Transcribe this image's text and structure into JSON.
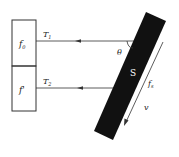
{
  "diagram": {
    "boxes": [
      {
        "label": "f",
        "subscript": "0"
      },
      {
        "label": "f'",
        "subscript": ""
      }
    ],
    "rays": [
      {
        "label": "T",
        "subscript": "1"
      },
      {
        "label": "T",
        "subscript": "2"
      }
    ],
    "angle_label": "θ",
    "bar_label": "S",
    "motion_labels": {
      "frequency": {
        "label": "f",
        "subscript": "s"
      },
      "velocity": "v"
    },
    "colors": {
      "line": "#333333",
      "bar": "#111111",
      "bar_text": "#ffffff",
      "background": "#ffffff"
    }
  }
}
